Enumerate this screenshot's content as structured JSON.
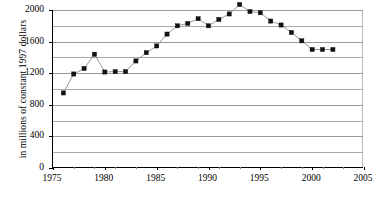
{
  "chart_data": {
    "type": "line",
    "title": "",
    "subtitle": "",
    "xlabel": "",
    "ylabel": "in millions of constant 1997 dollars",
    "xlim": [
      1975,
      2005
    ],
    "ylim": [
      0,
      2000
    ],
    "xticks": [
      1975,
      1980,
      1985,
      1990,
      1995,
      2000,
      2005
    ],
    "xtick_labels": [
      "1975",
      "1980",
      "1985",
      "1990",
      "1995",
      "2000",
      "2005"
    ],
    "xticks_minor": [
      1977,
      1979,
      1981,
      1983,
      1987,
      1989,
      1991,
      1993,
      1997,
      1999,
      2001,
      2003
    ],
    "yticks": [
      0,
      400,
      800,
      1200,
      1600,
      2000
    ],
    "ytick_labels": [
      "0",
      "400",
      "800",
      "1200",
      "1600",
      "2000"
    ],
    "gridlines_y": [
      200,
      400,
      600,
      800,
      1000,
      1200,
      1400,
      1600,
      1800,
      2000
    ],
    "grid": true,
    "legend": "none",
    "marker": "square",
    "marker_color": "#111111",
    "line_color": "#8d8d8d",
    "x": [
      1976,
      1977,
      1978,
      1979,
      1980,
      1981,
      1982,
      1983,
      1984,
      1985,
      1986,
      1987,
      1988,
      1989,
      1990,
      1991,
      1992,
      1993,
      1994,
      1995,
      1996,
      1997,
      1998,
      1999,
      2000,
      2001,
      2002
    ],
    "values": [
      950,
      1190,
      1260,
      1440,
      1215,
      1220,
      1220,
      1355,
      1460,
      1545,
      1695,
      1800,
      1830,
      1890,
      1800,
      1880,
      1950,
      2070,
      1980,
      1965,
      1860,
      1810,
      1715,
      1610,
      1500,
      1500,
      1500
    ],
    "series": [
      {
        "name": "value",
        "values": [
          950,
          1190,
          1260,
          1440,
          1215,
          1220,
          1220,
          1355,
          1460,
          1545,
          1695,
          1800,
          1830,
          1890,
          1800,
          1880,
          1950,
          2070,
          1980,
          1965,
          1860,
          1810,
          1715,
          1610,
          1500,
          1500,
          1500
        ]
      }
    ]
  }
}
